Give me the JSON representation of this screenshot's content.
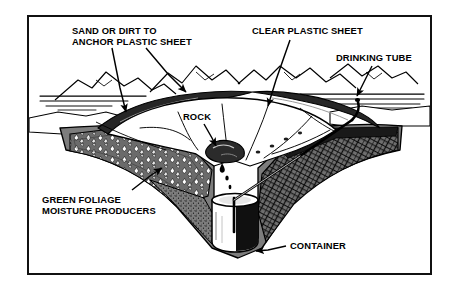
{
  "diagram": {
    "frame": {
      "border_color": "#111111",
      "background_color": "#ffffff"
    },
    "palette": {
      "ink": "#000000",
      "paper": "#ffffff",
      "soil_midtone": "#808080",
      "soil_dark": "#1a1a1a",
      "sheet": "#ffffff"
    },
    "labels": [
      {
        "id": "sand",
        "name": "sand-or-dirt-label",
        "line1": "SAND OR DIRT TO",
        "line2": "ANCHOR PLASTIC SHEET",
        "text": "SAND OR DIRT TO\nANCHOR PLASTIC SHEET",
        "arrow_count": 2,
        "points_to": "soil piled on plastic sheet rim"
      },
      {
        "id": "clear",
        "name": "clear-plastic-sheet-label",
        "line1": "CLEAR PLASTIC SHEET",
        "line2": "",
        "text": "CLEAR PLASTIC SHEET",
        "arrow_count": 1,
        "points_to": "white sheet spanning the pit"
      },
      {
        "id": "drinking",
        "name": "drinking-tube-label",
        "line1": "DRINKING TUBE",
        "line2": "",
        "text": "DRINKING TUBE",
        "arrow_count": 1,
        "points_to": "tube exiting pit at right rim"
      },
      {
        "id": "rock",
        "name": "rock-label",
        "line1": "ROCK",
        "line2": "",
        "text": "ROCK",
        "arrow_count": 1,
        "points_to": "weight stone at sheet low point"
      },
      {
        "id": "foliage",
        "name": "green-foliage-label",
        "line1": "GREEN FOLIAGE",
        "line2": "MOISTURE PRODUCERS",
        "text": "GREEN FOLIAGE\nMOISTURE PRODUCERS",
        "arrow_count": 1,
        "points_to": "vegetation lining pit wall"
      },
      {
        "id": "container",
        "name": "container-label",
        "line1": "CONTAINER",
        "line2": "",
        "text": "CONTAINER",
        "arrow_count": 1,
        "points_to": "collection cup at pit bottom"
      }
    ],
    "scene_elements": [
      {
        "name": "mountain-range",
        "description": "distant peaks along horizon"
      },
      {
        "name": "horizon-lines",
        "description": "horizontal desert floor hatching"
      },
      {
        "name": "pit-cutaway",
        "description": "V-shaped excavated hole in cross-section"
      },
      {
        "name": "left-pit-wall",
        "description": "gravel and foliage textured slope"
      },
      {
        "name": "right-pit-wall",
        "description": "cross-hatched rocky slope"
      },
      {
        "name": "plastic-sheet",
        "description": "clear sheet with radial crease lines"
      },
      {
        "name": "rock-weight",
        "description": "stone depressing sheet center"
      },
      {
        "name": "condensation-drops",
        "description": "droplets falling from sheet apex"
      },
      {
        "name": "container-cup",
        "description": "cylindrical collection vessel"
      },
      {
        "name": "drinking-tube",
        "description": "straw running from cup over rim"
      }
    ]
  }
}
